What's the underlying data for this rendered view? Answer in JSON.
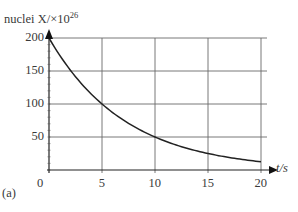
{
  "chart_data": {
    "type": "line",
    "title": "",
    "ylabel": "nuclei X/×10",
    "ylabel_exponent": "26",
    "xlabel": "t/s",
    "xlabel_italic_part": "t",
    "panel_label": "(a)",
    "xlim": [
      0,
      20
    ],
    "ylim": [
      0,
      200
    ],
    "xticks": [
      0,
      5,
      10,
      15,
      20
    ],
    "yticks": [
      50,
      100,
      150,
      200
    ],
    "grid": true,
    "series": [
      {
        "name": "nuclei X",
        "x": [
          0,
          2.5,
          5,
          7.5,
          10,
          12.5,
          15,
          17.5,
          20
        ],
        "values": [
          200,
          141.4,
          100,
          70.7,
          50,
          35.4,
          25,
          17.7,
          12.5
        ],
        "description": "exponential decay, half-life 5 s"
      }
    ],
    "colors": {
      "axis": "#222222",
      "grid": "#555555",
      "curve": "#222222"
    }
  }
}
